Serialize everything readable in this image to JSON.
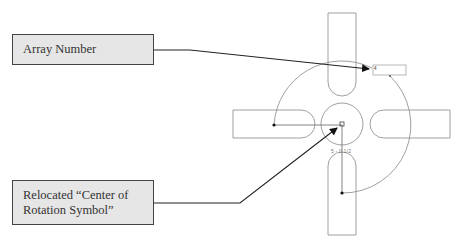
{
  "callouts": {
    "array_number": {
      "label": "Array Number"
    },
    "center_symbol": {
      "label": "Relocated “Center of Rotation Symbol”"
    }
  },
  "figure": {
    "hub_dimension_label": "5 - 0 1/2",
    "array_number_value": "4",
    "colors": {
      "callout_fill": "#e6e6e6",
      "callout_border": "#444444",
      "leader": "#222222",
      "geometry": "#888888"
    }
  }
}
